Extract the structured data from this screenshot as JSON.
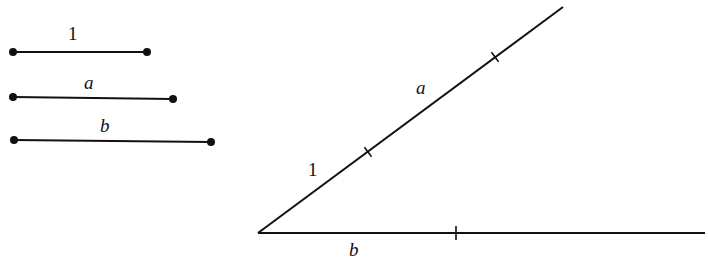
{
  "diagram": {
    "stroke_color": "#111111",
    "background": "#ffffff",
    "given_segments": [
      {
        "label": "1",
        "x1": 13,
        "y1": 52,
        "x2": 147,
        "y2": 52,
        "label_x": 68,
        "label_y": 24
      },
      {
        "label": "a",
        "x1": 13,
        "y1": 97,
        "x2": 173,
        "y2": 99,
        "label_x": 84,
        "label_y": 73
      },
      {
        "label": "b",
        "x1": 14,
        "y1": 140,
        "x2": 211,
        "y2": 142,
        "label_x": 100,
        "label_y": 116
      }
    ],
    "angle": {
      "vertex": [
        258,
        233
      ],
      "upper_ray_end": [
        563,
        7
      ],
      "lower_ray_end": [
        705,
        233
      ],
      "upper_ticks": [
        [
          368,
          152
        ],
        [
          495,
          57
        ]
      ],
      "lower_ticks": [
        [
          456,
          233
        ]
      ],
      "labels": [
        {
          "text": "1",
          "x": 308,
          "y": 160,
          "italic": false
        },
        {
          "text": "a",
          "x": 416,
          "y": 78,
          "italic": true
        },
        {
          "text": "b",
          "x": 349,
          "y": 240,
          "italic": true
        }
      ]
    }
  }
}
